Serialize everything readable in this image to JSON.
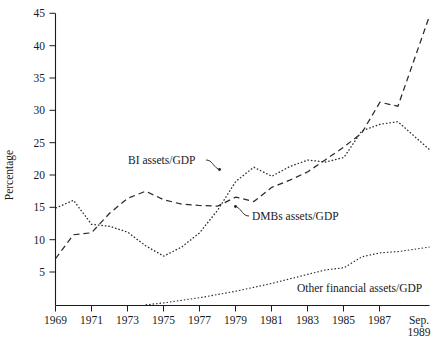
{
  "figure": {
    "background_color": "#ffffff",
    "line_color": "#2a2a2a",
    "axis_color": "#1a1a1a"
  },
  "axis": {
    "y_title": "Percentage",
    "y_ticks": [
      "5",
      "10",
      "15",
      "20",
      "25",
      "30",
      "35",
      "40",
      "45"
    ],
    "x_ticks": [
      "1969",
      "1971",
      "1973",
      "1975",
      "1977",
      "1979",
      "1981",
      "1983",
      "1985",
      "1987"
    ],
    "x_last_tick_line1": "Sep.",
    "x_last_tick_line2": "1989"
  },
  "annotations": [
    {
      "name": "bi-assets",
      "text": "BI assets/GDP"
    },
    {
      "name": "dmbs-assets",
      "text": "DMBs assets/GDP"
    },
    {
      "name": "other-financial-assets",
      "text": "Other financial assets/GDP"
    }
  ],
  "chart_data": {
    "type": "line",
    "title": "",
    "xlabel": "",
    "ylabel": "Percentage",
    "xlim": [
      1969,
      1989.75
    ],
    "ylim": [
      0,
      45
    ],
    "ytick_values": [
      5,
      10,
      15,
      20,
      25,
      30,
      35,
      40,
      45
    ],
    "xtick_values": [
      1969,
      1971,
      1973,
      1975,
      1977,
      1979,
      1981,
      1983,
      1985,
      1987,
      1989.75
    ],
    "xtick_labels": [
      "1969",
      "1971",
      "1973",
      "1975",
      "1977",
      "1979",
      "1981",
      "1983",
      "1985",
      "1987",
      "Sep. 1989"
    ],
    "grid": false,
    "legend_position": "inline-annotations",
    "x": [
      1969,
      1970,
      1971,
      1972,
      1973,
      1974,
      1975,
      1976,
      1977,
      1978,
      1979,
      1980,
      1981,
      1982,
      1983,
      1984,
      1985,
      1986,
      1987,
      1988,
      1989.75
    ],
    "series": [
      {
        "name": "DMBs assets/GDP",
        "style": "dashed",
        "values": [
          7.2,
          10.9,
          11.2,
          14.2,
          16.5,
          17.6,
          16.3,
          15.6,
          15.4,
          15.3,
          16.7,
          16.0,
          18.2,
          19.3,
          20.6,
          22.5,
          24.4,
          26.6,
          31.3,
          30.7,
          44.6
        ]
      },
      {
        "name": "BI assets/GDP",
        "style": "dotted",
        "values": [
          15.0,
          16.2,
          12.5,
          12.2,
          11.3,
          9.2,
          7.6,
          9.0,
          11.2,
          14.7,
          19.1,
          21.3,
          19.9,
          21.4,
          22.4,
          22.1,
          22.8,
          26.9,
          27.9,
          28.3,
          24.0
        ]
      },
      {
        "name": "Other financial assets/GDP",
        "style": "dotted",
        "values": [
          0.0,
          0.0,
          0.0,
          0.0,
          0.0,
          0.1,
          0.4,
          0.8,
          1.2,
          1.7,
          2.2,
          2.8,
          3.4,
          4.1,
          4.8,
          5.5,
          5.8,
          7.5,
          8.1,
          8.3,
          9.0
        ]
      }
    ]
  }
}
